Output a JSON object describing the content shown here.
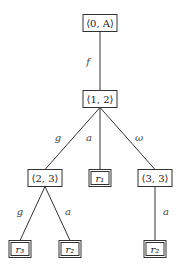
{
  "diagram": {
    "type": "tree",
    "nodes": [
      {
        "id": "n0",
        "label": "⟨0, A⟩",
        "x": 100,
        "y": 23,
        "w": 34,
        "h": 17,
        "leaf": false
      },
      {
        "id": "n1",
        "label": "⟨1, 2⟩",
        "x": 100,
        "y": 99,
        "w": 34,
        "h": 17,
        "leaf": false
      },
      {
        "id": "n2",
        "label": "⟨2, 3⟩",
        "x": 45,
        "y": 178,
        "w": 34,
        "h": 17,
        "leaf": false
      },
      {
        "id": "n3",
        "label": "r₁",
        "x": 100,
        "y": 178,
        "w": 22,
        "h": 17,
        "leaf": true
      },
      {
        "id": "n4",
        "label": "⟨3, 3⟩",
        "x": 155,
        "y": 178,
        "w": 34,
        "h": 17,
        "leaf": false
      },
      {
        "id": "n5",
        "label": "r₃",
        "x": 20,
        "y": 249,
        "w": 22,
        "h": 17,
        "leaf": true
      },
      {
        "id": "n6",
        "label": "r₂",
        "x": 70,
        "y": 249,
        "w": 22,
        "h": 17,
        "leaf": true
      },
      {
        "id": "n7",
        "label": "r₂",
        "x": 155,
        "y": 249,
        "w": 22,
        "h": 17,
        "leaf": true
      }
    ],
    "edges": [
      {
        "from": "n0",
        "to": "n1",
        "label": "f",
        "lx": 88,
        "ly": 65
      },
      {
        "from": "n1",
        "to": "n2",
        "label": "g",
        "lx": 58,
        "ly": 141
      },
      {
        "from": "n1",
        "to": "n3",
        "label": "a",
        "lx": 89,
        "ly": 141
      },
      {
        "from": "n1",
        "to": "n4",
        "label": "ω",
        "lx": 139,
        "ly": 141
      },
      {
        "from": "n2",
        "to": "n5",
        "label": "g",
        "lx": 20,
        "ly": 215
      },
      {
        "from": "n2",
        "to": "n6",
        "label": "a",
        "lx": 68,
        "ly": 215
      },
      {
        "from": "n4",
        "to": "n7",
        "label": "a",
        "lx": 166,
        "ly": 215
      }
    ]
  },
  "colors": {
    "line": "#333333",
    "box": "#333333",
    "background": "#ffffff"
  }
}
